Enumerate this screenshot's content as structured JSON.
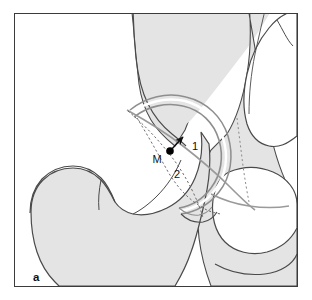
{
  "figure": {
    "panel_letter": "a",
    "type": "anatomical-line-drawing",
    "labels": {
      "center_point": "M",
      "measure_one": "1",
      "measure_two": "2"
    },
    "colors": {
      "frame": "#3b3b3b",
      "bone_fill": "#e4e4e4",
      "bone_outline": "#4a4a4a",
      "gray_curve": "#9a9a9a",
      "dashed_line": "#6a6a6a",
      "marker": "#000000",
      "background": "#ffffff"
    }
  }
}
